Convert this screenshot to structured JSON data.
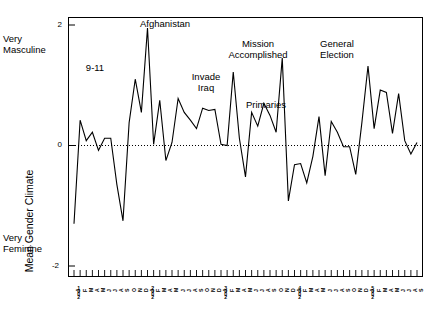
{
  "axes": {
    "y_label": "Mean Gender Climate",
    "y_ticks": [
      "2",
      "0",
      "-2"
    ],
    "top_corner_label": "Very\nMasculine",
    "bottom_corner_label": "Very\nFeminine"
  },
  "annotations": [
    {
      "text": "9-11",
      "x": 95,
      "y": 62
    },
    {
      "text": "Afghanistan",
      "x": 165,
      "y": 18
    },
    {
      "text": "Invade\nIraq",
      "x": 206,
      "y": 71
    },
    {
      "text": "Mission\nAccomplished",
      "x": 258,
      "y": 38
    },
    {
      "text": "Primaries",
      "x": 266,
      "y": 99
    },
    {
      "text": "General\nElection",
      "x": 337,
      "y": 38
    }
  ],
  "chart_data": {
    "type": "line",
    "title": "",
    "xlabel": "",
    "ylabel": "Mean Gender Climate",
    "ylim": [
      -2,
      2
    ],
    "yticks": [
      -2,
      0,
      2
    ],
    "grid": false,
    "zero_line": true,
    "legend": null,
    "y_axis_endpoint_labels": {
      "top": "Very Masculine",
      "bottom": "Very Feminine"
    },
    "month_letters": [
      "J",
      "F",
      "M",
      "A",
      "M",
      "J",
      "J",
      "A",
      "S",
      "O",
      "N",
      "D"
    ],
    "years": [
      "2001",
      "2002",
      "2003",
      "2004",
      "2005"
    ],
    "x": [
      "2001-01",
      "2001-02",
      "2001-03",
      "2001-04",
      "2001-05",
      "2001-06",
      "2001-07",
      "2001-08",
      "2001-09",
      "2001-10",
      "2001-11",
      "2001-12",
      "2002-01",
      "2002-02",
      "2002-03",
      "2002-04",
      "2002-05",
      "2002-06",
      "2002-07",
      "2002-08",
      "2002-09",
      "2002-10",
      "2002-11",
      "2002-12",
      "2003-01",
      "2003-02",
      "2003-03",
      "2003-04",
      "2003-05",
      "2003-06",
      "2003-07",
      "2003-08",
      "2003-09",
      "2003-10",
      "2003-11",
      "2003-12",
      "2004-01",
      "2004-02",
      "2004-03",
      "2004-04",
      "2004-05",
      "2004-06",
      "2004-07",
      "2004-08",
      "2004-09",
      "2004-10",
      "2004-11",
      "2004-12",
      "2005-01",
      "2005-02",
      "2005-03",
      "2005-04",
      "2005-05",
      "2005-06",
      "2005-07",
      "2005-08",
      "2005-09"
    ],
    "x_tick_labels": [
      "J",
      "F",
      "M",
      "A",
      "M",
      "J",
      "J",
      "A",
      "S",
      "O",
      "N",
      "D",
      "J",
      "F",
      "M",
      "A",
      "M",
      "J",
      "J",
      "A",
      "S",
      "O",
      "N",
      "D",
      "J",
      "F",
      "M",
      "A",
      "M",
      "J",
      "J",
      "A",
      "S",
      "O",
      "N",
      "D",
      "J",
      "F",
      "M",
      "A",
      "M",
      "J",
      "J",
      "A",
      "S",
      "O",
      "N",
      "D",
      "J",
      "F",
      "M",
      "A",
      "M",
      "J",
      "J",
      "A",
      "S"
    ],
    "values": [
      -1.3,
      0.42,
      0.08,
      0.22,
      -0.08,
      0.12,
      0.12,
      -0.65,
      -1.25,
      0.38,
      1.1,
      0.55,
      1.95,
      0.02,
      0.75,
      -0.25,
      0.05,
      0.78,
      0.55,
      0.42,
      0.28,
      0.62,
      0.58,
      0.6,
      0.02,
      0.0,
      1.22,
      0.12,
      -0.52,
      0.55,
      0.32,
      0.7,
      0.5,
      0.22,
      1.45,
      -0.92,
      -0.32,
      -0.3,
      -0.62,
      -0.18,
      0.48,
      -0.5,
      0.4,
      0.22,
      -0.02,
      -0.02,
      -0.48,
      0.38,
      1.32,
      0.28,
      0.92,
      0.88,
      0.2,
      0.86,
      0.08,
      -0.14,
      0.05
    ],
    "series_name": "Mean Gender Climate"
  }
}
